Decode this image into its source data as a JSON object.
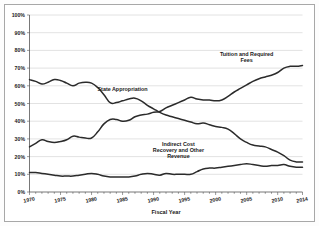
{
  "chart_data": {
    "type": "line",
    "title": "",
    "xlabel": "Fiscal Year",
    "ylabel": "",
    "xlim": [
      1970,
      2014
    ],
    "ylim": [
      0,
      100
    ],
    "grid": true,
    "legend_position": "inline-annotations",
    "y_tick_labels": [
      "0%",
      "10%",
      "20%",
      "30%",
      "40%",
      "50%",
      "60%",
      "70%",
      "80%",
      "90%",
      "100%"
    ],
    "y_ticks": [
      0,
      10,
      20,
      30,
      40,
      50,
      60,
      70,
      80,
      90,
      100
    ],
    "x_tick_labels": [
      "1970",
      "1975",
      "1980",
      "1985",
      "1990",
      "1995",
      "2000",
      "2005",
      "2010",
      "2014"
    ],
    "x_ticks": [
      1970,
      1975,
      1980,
      1985,
      1990,
      1995,
      2000,
      2005,
      2010,
      2014
    ],
    "x": [
      1970,
      1971,
      1972,
      1973,
      1974,
      1975,
      1976,
      1977,
      1978,
      1979,
      1980,
      1981,
      1982,
      1983,
      1984,
      1985,
      1986,
      1987,
      1988,
      1989,
      1990,
      1991,
      1992,
      1993,
      1994,
      1995,
      1996,
      1997,
      1998,
      1999,
      2000,
      2001,
      2002,
      2003,
      2004,
      2005,
      2006,
      2007,
      2008,
      2009,
      2010,
      2011,
      2012,
      2013,
      2014
    ],
    "series": [
      {
        "name": "State Appropriation",
        "label": "State Appropriation",
        "values": [
          63.5,
          62.5,
          61.0,
          62.0,
          63.5,
          63.0,
          61.5,
          60.0,
          61.5,
          62.0,
          61.5,
          59.0,
          55.0,
          50.5,
          50.5,
          51.5,
          52.5,
          53.0,
          51.5,
          49.0,
          47.0,
          45.0,
          43.5,
          42.5,
          41.5,
          40.5,
          39.5,
          38.5,
          39.0,
          38.0,
          37.0,
          36.5,
          35.5,
          33.0,
          30.0,
          28.0,
          26.5,
          26.0,
          25.5,
          24.0,
          22.5,
          20.5,
          18.0,
          17.0,
          17.0
        ]
      },
      {
        "name": "Tuition and Required Fees",
        "label": "Tuition and Required Fees",
        "values": [
          25.5,
          27.5,
          29.5,
          28.5,
          28.0,
          28.5,
          29.5,
          31.5,
          31.0,
          30.5,
          30.5,
          34.0,
          38.5,
          41.0,
          41.0,
          40.0,
          40.5,
          42.5,
          43.5,
          44.0,
          45.0,
          45.5,
          47.5,
          49.0,
          50.5,
          52.0,
          53.5,
          52.5,
          52.0,
          52.0,
          51.5,
          52.0,
          54.0,
          56.5,
          58.5,
          60.5,
          62.5,
          64.0,
          65.0,
          66.0,
          67.5,
          70.0,
          71.0,
          71.0,
          71.5
        ]
      },
      {
        "name": "Indirect Cost Recovery and Other Revenue",
        "label": "Indirect Cost Recovery and Other Revenue",
        "values": [
          11.0,
          11.0,
          10.5,
          10.0,
          9.5,
          9.0,
          9.0,
          9.0,
          9.5,
          10.0,
          10.5,
          10.0,
          9.0,
          8.5,
          8.5,
          8.5,
          8.5,
          9.0,
          10.0,
          10.5,
          10.0,
          9.5,
          10.5,
          10.0,
          10.0,
          10.0,
          10.0,
          11.5,
          13.0,
          13.5,
          13.5,
          14.0,
          14.5,
          15.0,
          15.5,
          16.0,
          15.5,
          15.0,
          14.5,
          15.0,
          15.0,
          15.5,
          14.5,
          14.0,
          14.0
        ]
      }
    ],
    "annotations": [
      {
        "text_line1": "State Appropriation",
        "x": 1985,
        "y": 57
      },
      {
        "text_line1": "Tuition and Required",
        "text_line2": "Fees",
        "x": 2005,
        "y": 77
      },
      {
        "text_line1": "Indirect Cost",
        "text_line2": "Recovery and Other",
        "text_line3": "Revenue",
        "x": 1994,
        "y": 26
      }
    ]
  }
}
